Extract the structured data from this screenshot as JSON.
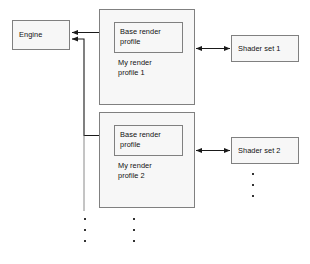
{
  "diagram": {
    "type": "block-diagram",
    "canvas": {
      "width": 310,
      "height": 264
    },
    "style": {
      "node_fill": "#f7f7f7",
      "node_border": "#808080",
      "connector_color": "#1a1a1a",
      "text_color": "#111111"
    },
    "nodes": {
      "engine": {
        "label": "Engine",
        "x": 12,
        "y": 20,
        "w": 58,
        "h": 30
      },
      "profile1": {
        "label": "My render\nprofile 1",
        "x": 99,
        "y": 9,
        "w": 96,
        "h": 96
      },
      "base1": {
        "label": "Base render\nprofile",
        "x": 114,
        "y": 22,
        "w": 69,
        "h": 31
      },
      "profile2": {
        "label": "My render\nprofile 2",
        "x": 99,
        "y": 112,
        "w": 96,
        "h": 96
      },
      "base2": {
        "label": "Base render\nprofile",
        "x": 114,
        "y": 125,
        "w": 69,
        "h": 31
      },
      "shader1": {
        "label": "Shader set 1",
        "x": 231,
        "y": 35,
        "w": 68,
        "h": 27
      },
      "shader2": {
        "label": "Shader set 2",
        "x": 231,
        "y": 137,
        "w": 68,
        "h": 27
      }
    },
    "connectors": [
      {
        "name": "engine-to-base-render-profile-1",
        "from": "engine",
        "to": "base1",
        "arrow": "both"
      },
      {
        "name": "engine-to-base-render-profile-2",
        "from": "engine",
        "to": "base2",
        "arrow": "both"
      },
      {
        "name": "profile-1-to-shader-set-1",
        "from": "profile1",
        "to": "shader1",
        "arrow": "both"
      },
      {
        "name": "profile-2-to-shader-set-2",
        "from": "profile2",
        "to": "shader2",
        "arrow": "both"
      }
    ],
    "ellipses": [
      {
        "name": "more-engine-connections",
        "x": 84,
        "y": 218,
        "count": 3
      },
      {
        "name": "more-render-profiles",
        "x": 133,
        "y": 218,
        "count": 3
      },
      {
        "name": "more-shader-sets",
        "x": 252,
        "y": 173,
        "count": 3
      }
    ],
    "separator": {
      "name": "profile-2-separator",
      "x1": 117,
      "y1": 190,
      "x2": 157,
      "y2": 190
    }
  }
}
